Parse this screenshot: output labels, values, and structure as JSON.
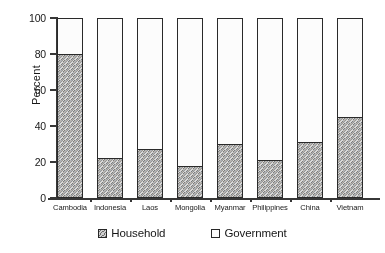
{
  "chart_data": {
    "type": "bar",
    "title": "",
    "subtitle": "",
    "xlabel": "",
    "ylabel": "Percent",
    "ylim": [
      0,
      100
    ],
    "yticks": [
      0,
      20,
      40,
      60,
      80,
      100
    ],
    "grid": false,
    "stacked": true,
    "stack_total": 100,
    "legend_position": "bottom",
    "categories": [
      "Cambodia",
      "Indonesia",
      "Laos",
      "Mongolia",
      "Myanmar",
      "Philippines",
      "China",
      "Vietnam"
    ],
    "series": [
      {
        "name": "Household",
        "values": [
          80,
          22,
          27,
          18,
          30,
          21,
          31,
          45
        ]
      },
      {
        "name": "Government",
        "values": [
          20,
          78,
          73,
          82,
          70,
          79,
          69,
          55
        ]
      }
    ]
  },
  "axis": {
    "y_title": "Percent",
    "y_tick_labels": [
      "100",
      "80",
      "60",
      "40",
      "20",
      "0"
    ]
  },
  "legend": {
    "items": [
      {
        "label": "Household",
        "swatch": "hatched-gray-swatch"
      },
      {
        "label": "Government",
        "swatch": "white-swatch"
      }
    ]
  },
  "colors": {
    "household_fill": "#a9a9a9",
    "government_fill": "#ffffff",
    "axis": "#3a3a3a",
    "bar_outline": "#2e2e2e",
    "text": "#1a1a1a",
    "background": "#ffffff"
  }
}
